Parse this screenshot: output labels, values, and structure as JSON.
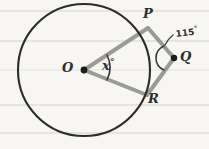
{
  "page": {
    "background_color": "#f7f6f3",
    "width": 209,
    "height": 149
  },
  "paper": {
    "rule_color": "#e2e0db",
    "rule_y_positions": [
      11,
      41,
      70,
      105,
      133
    ]
  },
  "figure": {
    "type": "circle-with-external-point",
    "circle": {
      "label": "circle",
      "center_label": "O",
      "cx": 84,
      "cy": 70,
      "r": 66,
      "stroke_color": "#2b2b2b",
      "stroke_width": 2
    },
    "center_point": {
      "label": "O",
      "x": 84,
      "y": 70,
      "dot_color": "#1a1a1a"
    },
    "points": [
      {
        "label": "P",
        "x": 148,
        "y": 27,
        "on_circle": true
      },
      {
        "label": "Q",
        "x": 174,
        "y": 58,
        "on_circle": false
      },
      {
        "label": "R",
        "x": 147,
        "y": 96,
        "on_circle": true
      }
    ],
    "segments": [
      {
        "name": "OP",
        "from": "O",
        "to": "P",
        "color": "#9a9a9a",
        "width": 4
      },
      {
        "name": "OR",
        "from": "O",
        "to": "R",
        "color": "#9a9a9a",
        "width": 4
      },
      {
        "name": "PQ",
        "from": "P",
        "to": "Q",
        "color": "#9a9a9a",
        "width": 4
      },
      {
        "name": "QR",
        "from": "Q",
        "to": "R",
        "color": "#9a9a9a",
        "width": 4
      }
    ],
    "angles": [
      {
        "name": "angle-at-center",
        "vertex": "O",
        "label": "x",
        "unit": "°",
        "value": null,
        "arc_color": "#3a3a3a"
      },
      {
        "name": "angle-at-Q",
        "vertex": "Q",
        "label": "115",
        "unit": "°",
        "value": 115,
        "arc_color": "#3a3a3a"
      }
    ]
  },
  "labels": {
    "P": "P",
    "Q": "Q",
    "R": "R",
    "O": "O",
    "x_angle": "x",
    "x_angle_degree": "°",
    "q_angle": "115",
    "q_angle_degree": "°"
  }
}
